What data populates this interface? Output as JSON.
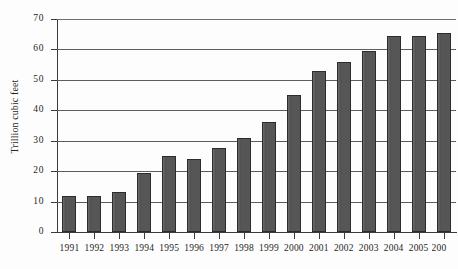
{
  "chart_data": {
    "type": "bar",
    "title": "",
    "subtitle": "",
    "xlabel": "",
    "ylabel": "Trillion cubic feet",
    "categories": [
      "1991",
      "1992",
      "1993",
      "1994",
      "1995",
      "1996",
      "1997",
      "1998",
      "1999",
      "2000",
      "2001",
      "2002",
      "2003",
      "2004",
      "2005",
      "2006"
    ],
    "values": [
      12,
      12,
      13,
      19.5,
      25,
      24,
      27.5,
      31,
      36,
      45,
      53,
      56,
      59.5,
      64.5,
      64.5,
      65.5
    ],
    "ylim": [
      0,
      70
    ],
    "yticks": [
      0,
      10,
      20,
      30,
      40,
      50,
      60,
      70
    ],
    "ytick_labels": [
      "0",
      "10",
      "20",
      "30",
      "40",
      "50",
      "60",
      "70"
    ],
    "grid": true,
    "grid_axis": "y",
    "legend": false,
    "legend_position": "none",
    "bar_color": "#565656",
    "bar_edge_color": "#2c2c2c",
    "axis_color": "#3a3a3a",
    "grid_color": "#5d5d5d",
    "background_color": "#fdfdfd",
    "last_label_clipped": true,
    "last_label_visible_text": "200"
  }
}
